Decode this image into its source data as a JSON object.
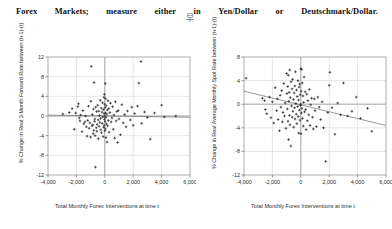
{
  "document": {
    "heading_words": [
      "Forex",
      "Markets;",
      "measure",
      "either",
      "in",
      "Yen/Dollar",
      "or",
      "Deutschmark/Dollar."
    ],
    "heading_text": "Forex Markets; measure either in Yen/Dollar or Deutschmark/Dollar.",
    "stray_glyph": "早"
  },
  "colors": {
    "point": "#2a2a2a",
    "grid": "#d2d2d2",
    "frame": "#8a8a8a",
    "axis": "#9a9a9a",
    "trend": "#7d7d7d",
    "text": "#2b2b2b",
    "background": "#ffffff"
  },
  "chart_data": [
    {
      "id": "forward-rate-scatter",
      "type": "scatter",
      "title": "",
      "xlabel": "Total Monthly Forex Interventions at time t",
      "ylabel": "% Change in Real 3-Month Forward Rate between (t+1)-(t)",
      "xlim": [
        -4000,
        6000
      ],
      "ylim": [
        -12,
        12
      ],
      "xticks": [
        -4000,
        -2000,
        0,
        2000,
        4000,
        6000
      ],
      "xticklabels": [
        "-4,000",
        "-2,000",
        "0",
        "2,000",
        "4,000",
        "6,000"
      ],
      "yticks": [
        12,
        8,
        4,
        0,
        -4,
        -8,
        -12
      ],
      "yticklabels": [
        "12",
        "8",
        "4",
        "0",
        "-4",
        "-8",
        "-12"
      ],
      "grid": true,
      "legend": "none",
      "trendline": {
        "x0": -4000,
        "y0": 0.18,
        "x1": 6000,
        "y1": -0.25
      },
      "points": [
        [
          -2950,
          0.4
        ],
        [
          -2500,
          0.7
        ],
        [
          -2300,
          1.5
        ],
        [
          -2150,
          -2.7
        ],
        [
          -2050,
          0.6
        ],
        [
          -1900,
          1.9
        ],
        [
          -1850,
          2.5
        ],
        [
          -1800,
          -0.4
        ],
        [
          -1750,
          -1.0
        ],
        [
          -1700,
          0.2
        ],
        [
          -1600,
          -3.2
        ],
        [
          -1550,
          1.1
        ],
        [
          -1480,
          -1.6
        ],
        [
          -1400,
          -1.2
        ],
        [
          -1350,
          0.0
        ],
        [
          -1300,
          -2.2
        ],
        [
          -1250,
          -4.1
        ],
        [
          -1200,
          -0.9
        ],
        [
          -1150,
          2.0
        ],
        [
          -1100,
          -2.5
        ],
        [
          -1050,
          -1.4
        ],
        [
          -1000,
          -4.3
        ],
        [
          -980,
          3.0
        ],
        [
          -950,
          10.1
        ],
        [
          -900,
          -2.0
        ],
        [
          -880,
          0.3
        ],
        [
          -850,
          -1.8
        ],
        [
          -820,
          -3.6
        ],
        [
          -800,
          1.4
        ],
        [
          -780,
          -2.9
        ],
        [
          -760,
          6.8
        ],
        [
          -720,
          -1.1
        ],
        [
          -700,
          -0.6
        ],
        [
          -680,
          -4.0
        ],
        [
          -660,
          -10.4
        ],
        [
          -640,
          1.8
        ],
        [
          -600,
          -2.4
        ],
        [
          -580,
          0.9
        ],
        [
          -560,
          -3.1
        ],
        [
          -540,
          -1.7
        ],
        [
          -500,
          2.2
        ],
        [
          -470,
          -0.8
        ],
        [
          -450,
          -4.6
        ],
        [
          -420,
          1.0
        ],
        [
          -400,
          -2.1
        ],
        [
          -380,
          0.1
        ],
        [
          -350,
          -1.3
        ],
        [
          -320,
          3.2
        ],
        [
          -300,
          -0.5
        ],
        [
          -280,
          -2.8
        ],
        [
          -250,
          1.6
        ],
        [
          -230,
          -3.4
        ],
        [
          -200,
          0.8
        ],
        [
          -180,
          -1.5
        ],
        [
          -160,
          2.7
        ],
        [
          -140,
          -0.2
        ],
        [
          -120,
          -4.2
        ],
        [
          -100,
          1.3
        ],
        [
          -80,
          -2.3
        ],
        [
          -60,
          3.8
        ],
        [
          -50,
          0.5
        ],
        [
          -40,
          -1.9
        ],
        [
          -30,
          4.4
        ],
        [
          -20,
          -0.7
        ],
        [
          -10,
          2.4
        ],
        [
          0,
          -3.0
        ],
        [
          0,
          0.0
        ],
        [
          10,
          1.7
        ],
        [
          20,
          -1.1
        ],
        [
          30,
          6.6
        ],
        [
          40,
          -2.6
        ],
        [
          50,
          0.6
        ],
        [
          60,
          3.5
        ],
        [
          70,
          -0.3
        ],
        [
          80,
          -4.4
        ],
        [
          100,
          2.1
        ],
        [
          120,
          -1.6
        ],
        [
          140,
          0.4
        ],
        [
          160,
          -5.3
        ],
        [
          180,
          1.2
        ],
        [
          200,
          -2.0
        ],
        [
          230,
          3.1
        ],
        [
          250,
          -0.9
        ],
        [
          280,
          1.5
        ],
        [
          300,
          -3.3
        ],
        [
          350,
          0.7
        ],
        [
          400,
          2.6
        ],
        [
          450,
          -1.2
        ],
        [
          500,
          -0.4
        ],
        [
          550,
          1.9
        ],
        [
          600,
          -2.7
        ],
        [
          650,
          0.2
        ],
        [
          700,
          -4.5
        ],
        [
          750,
          2.9
        ],
        [
          800,
          -1.0
        ],
        [
          850,
          0.9
        ],
        [
          900,
          -5.4
        ],
        [
          950,
          1.1
        ],
        [
          1000,
          -0.6
        ],
        [
          1100,
          -3.8
        ],
        [
          1200,
          2.3
        ],
        [
          1300,
          -1.4
        ],
        [
          1400,
          0.3
        ],
        [
          1500,
          -2.2
        ],
        [
          1600,
          1.0
        ],
        [
          1800,
          -0.8
        ],
        [
          1900,
          1.8
        ],
        [
          2000,
          -1.9
        ],
        [
          2100,
          0.5
        ],
        [
          2300,
          2.0
        ],
        [
          2400,
          6.7
        ],
        [
          2550,
          11.1
        ],
        [
          2600,
          -1.5
        ],
        [
          2800,
          0.8
        ],
        [
          3000,
          -0.3
        ],
        [
          3200,
          -4.7
        ],
        [
          3500,
          0.6
        ],
        [
          4000,
          2.2
        ],
        [
          4200,
          -0.2
        ],
        [
          5000,
          0.0
        ]
      ]
    },
    {
      "id": "spot-rate-scatter",
      "type": "scatter",
      "title": "",
      "xlabel": "Total Monthly Forex Interventions at time t",
      "ylabel": "% Change in Real Average Monthly Spot Rate between (t+1)-(t)",
      "xlim": [
        -4000,
        6000
      ],
      "ylim": [
        -12,
        8
      ],
      "xticks": [
        -4000,
        -2000,
        0,
        2000,
        4000,
        6000
      ],
      "xticklabels": [
        "-4,000",
        "-2,000",
        "0",
        "2,000",
        "4,000",
        "6,000"
      ],
      "yticks": [
        8,
        4,
        0,
        -4,
        -8,
        -12
      ],
      "yticklabels": [
        "8",
        "4",
        "0",
        "-4",
        "-8",
        "-12"
      ],
      "grid": true,
      "legend": "none",
      "trendline": {
        "x0": -4000,
        "y0": 2.2,
        "x1": 6000,
        "y1": -3.6
      },
      "points": [
        [
          -3850,
          4.4
        ],
        [
          -2700,
          1.0
        ],
        [
          -2550,
          0.6
        ],
        [
          -2500,
          -0.9
        ],
        [
          -2400,
          -1.6
        ],
        [
          -2200,
          1.2
        ],
        [
          -2100,
          -2.3
        ],
        [
          -2000,
          0.4
        ],
        [
          -1900,
          -3.2
        ],
        [
          -1800,
          2.8
        ],
        [
          -1700,
          -1.1
        ],
        [
          -1650,
          0.9
        ],
        [
          -1600,
          -2.6
        ],
        [
          -1500,
          -4.5
        ],
        [
          -1450,
          1.5
        ],
        [
          -1400,
          -0.5
        ],
        [
          -1350,
          2.3
        ],
        [
          -1300,
          -3.0
        ],
        [
          -1250,
          -1.4
        ],
        [
          -1200,
          3.5
        ],
        [
          -1150,
          -2.0
        ],
        [
          -1100,
          0.2
        ],
        [
          -1050,
          -4.1
        ],
        [
          -1000,
          5.2
        ],
        [
          -980,
          1.8
        ],
        [
          -950,
          -0.8
        ],
        [
          -920,
          3.0
        ],
        [
          -900,
          -2.9
        ],
        [
          -880,
          4.9
        ],
        [
          -860,
          -6.0
        ],
        [
          -840,
          0.5
        ],
        [
          -820,
          2.0
        ],
        [
          -800,
          -1.9
        ],
        [
          -780,
          5.8
        ],
        [
          -760,
          -3.5
        ],
        [
          -740,
          1.1
        ],
        [
          -700,
          -7.1
        ],
        [
          -680,
          3.8
        ],
        [
          -650,
          -0.3
        ],
        [
          -620,
          2.6
        ],
        [
          -600,
          -2.2
        ],
        [
          -580,
          4.2
        ],
        [
          -550,
          -1.2
        ],
        [
          -520,
          0.8
        ],
        [
          -500,
          -3.9
        ],
        [
          -470,
          1.9
        ],
        [
          -440,
          -0.6
        ],
        [
          -420,
          3.1
        ],
        [
          -400,
          -2.5
        ],
        [
          -380,
          5.5
        ],
        [
          -350,
          0.1
        ],
        [
          -320,
          -1.7
        ],
        [
          -300,
          2.4
        ],
        [
          -280,
          -3.3
        ],
        [
          -250,
          1.3
        ],
        [
          -220,
          -0.4
        ],
        [
          -200,
          4.0
        ],
        [
          -180,
          -2.1
        ],
        [
          -160,
          0.7
        ],
        [
          -140,
          -4.9
        ],
        [
          -120,
          2.9
        ],
        [
          -100,
          -1.0
        ],
        [
          -80,
          3.4
        ],
        [
          -60,
          -2.7
        ],
        [
          -40,
          1.6
        ],
        [
          -20,
          -0.2
        ],
        [
          0,
          6.0
        ],
        [
          0,
          0.0
        ],
        [
          10,
          -5.0
        ],
        [
          20,
          2.2
        ],
        [
          40,
          -1.5
        ],
        [
          60,
          5.9
        ],
        [
          80,
          -0.7
        ],
        [
          100,
          3.6
        ],
        [
          120,
          -2.4
        ],
        [
          150,
          1.4
        ],
        [
          180,
          -3.7
        ],
        [
          200,
          0.3
        ],
        [
          230,
          4.6
        ],
        [
          260,
          -1.3
        ],
        [
          300,
          2.1
        ],
        [
          340,
          -0.9
        ],
        [
          380,
          -4.3
        ],
        [
          420,
          1.7
        ],
        [
          460,
          -2.8
        ],
        [
          500,
          0.6
        ],
        [
          560,
          -1.8
        ],
        [
          600,
          2.5
        ],
        [
          650,
          -3.6
        ],
        [
          700,
          -0.1
        ],
        [
          760,
          1.0
        ],
        [
          820,
          -2.2
        ],
        [
          880,
          -4.2
        ],
        [
          950,
          0.9
        ],
        [
          1000,
          -1.1
        ],
        [
          1100,
          -3.8
        ],
        [
          1200,
          1.2
        ],
        [
          1300,
          -0.5
        ],
        [
          1400,
          -2.6
        ],
        [
          1500,
          0.4
        ],
        [
          1600,
          -4.0
        ],
        [
          1750,
          -9.7
        ],
        [
          1900,
          -1.4
        ],
        [
          2000,
          3.2
        ],
        [
          2050,
          5.4
        ],
        [
          2200,
          -0.6
        ],
        [
          2400,
          -5.1
        ],
        [
          2600,
          0.2
        ],
        [
          2800,
          -1.8
        ],
        [
          3000,
          3.6
        ],
        [
          3300,
          -2.0
        ],
        [
          3600,
          -1.2
        ],
        [
          3900,
          1.2
        ],
        [
          4200,
          -2.4
        ],
        [
          4700,
          -0.7
        ],
        [
          5000,
          -4.6
        ]
      ]
    }
  ]
}
